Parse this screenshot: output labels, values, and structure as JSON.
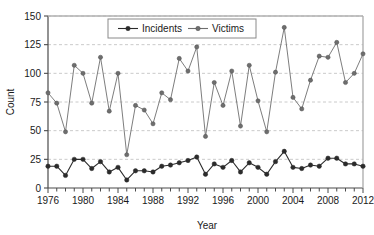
{
  "chart_data": {
    "type": "line",
    "title": "",
    "xlabel": "Year",
    "ylabel": "Count",
    "xlim": [
      1976,
      2012
    ],
    "ylim": [
      0,
      150
    ],
    "yticks": [
      0,
      25,
      50,
      75,
      100,
      125,
      150
    ],
    "xticks": [
      1976,
      1980,
      1984,
      1988,
      1992,
      1996,
      2000,
      2004,
      2008,
      2012
    ],
    "xtick_labels": [
      "1976",
      "1980",
      "1984",
      "1988",
      "1992",
      "1996",
      "2000",
      "2004",
      "2008",
      "2012"
    ],
    "ytick_labels": [
      "0",
      "25",
      "50",
      "75",
      "100",
      "125",
      "150"
    ],
    "grid": true,
    "grid_axis": "y",
    "legend_position": "top-center",
    "x": [
      1976,
      1977,
      1978,
      1979,
      1980,
      1981,
      1982,
      1983,
      1984,
      1985,
      1986,
      1987,
      1988,
      1989,
      1990,
      1991,
      1992,
      1993,
      1994,
      1995,
      1996,
      1997,
      1998,
      1999,
      2000,
      2001,
      2002,
      2003,
      2004,
      2005,
      2006,
      2007,
      2008,
      2009,
      2010,
      2011,
      2012
    ],
    "series": [
      {
        "name": "Incidents",
        "color": "#2b2b2b",
        "marker": "circle",
        "values": [
          19,
          19,
          11,
          25,
          25,
          17,
          23,
          14,
          18,
          7,
          15,
          15,
          14,
          19,
          20,
          22,
          24,
          27,
          12,
          21,
          18,
          24,
          14,
          22,
          18,
          12,
          23,
          32,
          18,
          17,
          20,
          19,
          26,
          26,
          21,
          21,
          19
        ]
      },
      {
        "name": "Victims",
        "color": "#6e6e6e",
        "marker": "circle",
        "values": [
          83,
          74,
          49,
          107,
          100,
          74,
          114,
          67,
          100,
          29,
          72,
          68,
          56,
          83,
          77,
          113,
          102,
          123,
          45,
          92,
          72,
          102,
          54,
          107,
          76,
          49,
          101,
          140,
          79,
          69,
          94,
          115,
          114,
          127,
          92,
          100,
          117
        ]
      }
    ]
  },
  "legend": {
    "items": [
      {
        "label": "Incidents",
        "color": "#2b2b2b"
      },
      {
        "label": "Victims",
        "color": "#6e6e6e"
      }
    ]
  },
  "axes": {
    "x_title": "Year",
    "y_title": "Count"
  }
}
